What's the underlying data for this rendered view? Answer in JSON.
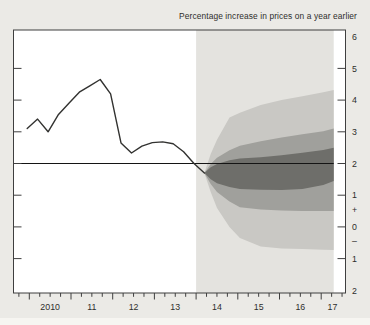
{
  "page": {
    "background": "#ebeae6"
  },
  "chart_data": {
    "type": "line",
    "subtype": "fan-chart",
    "title": "Percentage increase in prices on a year earlier",
    "target_value": 2,
    "axis_ranges": {
      "x": [
        2009.62,
        2017.59
      ],
      "y": [
        -2.09,
        6.21
      ]
    },
    "grid": "off",
    "legend": "none",
    "x_axis": {
      "major_ticks": [
        2010,
        2011,
        2012,
        2013,
        2014,
        2015,
        2016,
        2017
      ],
      "minor_tick_step": 0.25,
      "labels": [
        {
          "text": "2010",
          "center": 2010.5
        },
        {
          "text": "11",
          "center": 2011.5
        },
        {
          "text": "12",
          "center": 2012.5
        },
        {
          "text": "13",
          "center": 2013.5
        },
        {
          "text": "14",
          "center": 2014.5
        },
        {
          "text": "15",
          "center": 2015.5
        },
        {
          "text": "16",
          "center": 2016.5
        },
        {
          "text": "17",
          "center": 2017.27
        }
      ]
    },
    "y_axis": {
      "side": "right",
      "tick_values": [
        5,
        4,
        3,
        2,
        1,
        0,
        -1
      ],
      "labels": [
        {
          "text": "6",
          "value": 6
        },
        {
          "text": "5",
          "value": 5
        },
        {
          "text": "4",
          "value": 4
        },
        {
          "text": "3",
          "value": 3
        },
        {
          "text": "2",
          "value": 2
        },
        {
          "text": "1",
          "value": 1
        },
        {
          "text": "+",
          "value": 0.55
        },
        {
          "text": "0",
          "value": 0
        },
        {
          "text": "–",
          "value": -0.45
        },
        {
          "text": "1",
          "value": -1
        },
        {
          "text": "2",
          "value": -2
        }
      ]
    },
    "history": {
      "name": "inflation-outturn-line",
      "x": [
        2009.95,
        2010.2,
        2010.45,
        2010.7,
        2010.95,
        2011.2,
        2011.45,
        2011.7,
        2011.95,
        2012.2,
        2012.45,
        2012.7,
        2012.95,
        2013.2,
        2013.45,
        2013.7,
        2013.95,
        2014.2
      ],
      "y": [
        3.1,
        3.4,
        3.0,
        3.55,
        3.9,
        4.25,
        4.45,
        4.65,
        4.2,
        2.65,
        2.33,
        2.55,
        2.66,
        2.68,
        2.62,
        2.37,
        2.0,
        1.7
      ]
    },
    "fan": {
      "x": [
        2014.2,
        2014.35,
        2014.5,
        2014.8,
        2015.05,
        2015.55,
        2016.05,
        2016.55,
        2017.05,
        2017.3
      ],
      "bands": [
        {
          "name": "outer-band",
          "top": [
            1.7,
            2.3,
            2.75,
            3.45,
            3.6,
            3.85,
            4.0,
            4.12,
            4.25,
            4.32
          ],
          "bottom": [
            1.7,
            1.1,
            0.6,
            0.0,
            -0.35,
            -0.62,
            -0.68,
            -0.7,
            -0.72,
            -0.73
          ],
          "color": "#c9c8c4"
        },
        {
          "name": "middle-band",
          "top": [
            1.7,
            1.98,
            2.18,
            2.42,
            2.56,
            2.7,
            2.82,
            2.92,
            3.02,
            3.1
          ],
          "bottom": [
            1.7,
            1.35,
            1.1,
            0.8,
            0.62,
            0.55,
            0.52,
            0.5,
            0.5,
            0.5
          ],
          "color": "#a0a09c"
        },
        {
          "name": "central-band",
          "top": [
            1.7,
            1.88,
            1.98,
            2.1,
            2.16,
            2.2,
            2.26,
            2.34,
            2.43,
            2.5
          ],
          "bottom": [
            1.7,
            1.5,
            1.38,
            1.26,
            1.2,
            1.17,
            1.16,
            1.2,
            1.32,
            1.45
          ],
          "color": "#6e6e6a"
        }
      ]
    },
    "projection_region": {
      "start": 2014.0,
      "end": 2017.3
    },
    "colors": {
      "page_background": "#ebeae6",
      "plot_background": "#ffffff",
      "projection_background": "#e4e3df",
      "history_line": "#323230",
      "target_line": "#141414",
      "frame": "#3f3f3f",
      "tick": "#3f3f3f",
      "text": "#2e2e2c"
    }
  }
}
